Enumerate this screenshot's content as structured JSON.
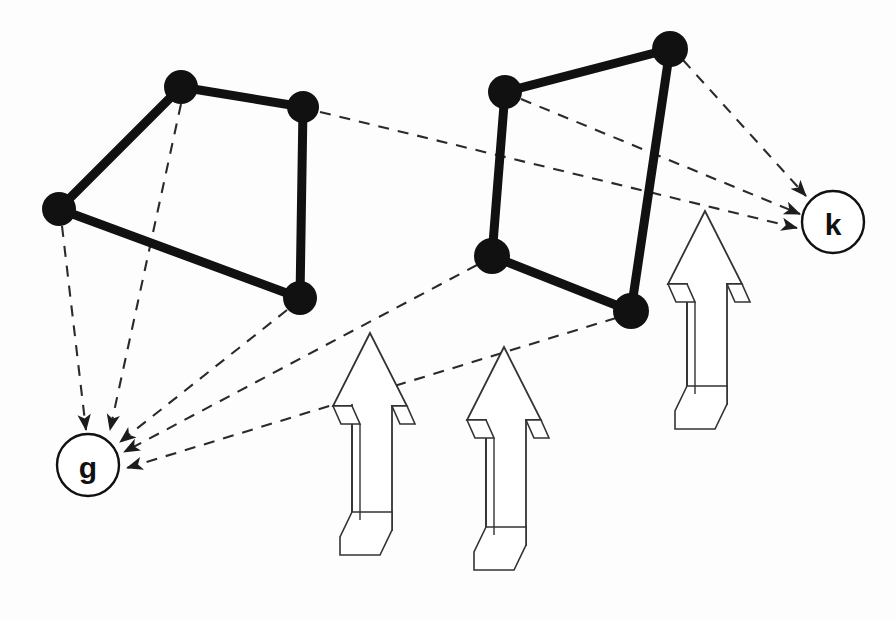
{
  "figure": {
    "background_color": "#fdfdfd",
    "stroke_color": "#111111",
    "solid_edge_color": "#111111",
    "dashed_edge_color": "#2a2a2a",
    "arrow_outline_color": "#333333",
    "arrow_fill_color": "#ffffff"
  },
  "labelled_nodes": [
    {
      "id": "g",
      "label": "g",
      "cx": 88,
      "cy": 465,
      "r": 31
    },
    {
      "id": "k",
      "label": "k",
      "cx": 833,
      "cy": 222,
      "r": 31
    }
  ],
  "clusters": [
    {
      "id": "left-quad",
      "name": "left-quadrilateral",
      "nodes": [
        {
          "id": "L1",
          "cx": 181,
          "cy": 87,
          "r": 17
        },
        {
          "id": "L2",
          "cx": 303,
          "cy": 107,
          "r": 16
        },
        {
          "id": "L3",
          "cx": 59,
          "cy": 209,
          "r": 17
        },
        {
          "id": "L4",
          "cx": 300,
          "cy": 298,
          "r": 17
        }
      ],
      "edges": [
        {
          "from": "L1",
          "to": "L2"
        },
        {
          "from": "L1",
          "to": "L3"
        },
        {
          "from": "L3",
          "to": "L4"
        },
        {
          "from": "L2",
          "to": "L4"
        }
      ]
    },
    {
      "id": "right-quad",
      "name": "right-quadrilateral",
      "nodes": [
        {
          "id": "R1",
          "cx": 505,
          "cy": 92,
          "r": 17
        },
        {
          "id": "R2",
          "cx": 670,
          "cy": 49,
          "r": 18
        },
        {
          "id": "R3",
          "cx": 492,
          "cy": 256,
          "r": 18
        },
        {
          "id": "R4",
          "cx": 631,
          "cy": 311,
          "r": 18
        }
      ],
      "edges": [
        {
          "from": "R1",
          "to": "R2"
        },
        {
          "from": "R1",
          "to": "R3"
        },
        {
          "from": "R3",
          "to": "R4"
        },
        {
          "from": "R2",
          "to": "R4"
        }
      ]
    }
  ],
  "mapping_edges": [
    {
      "id": "m1",
      "from": "L1",
      "to": "g",
      "x1": 181,
      "y1": 104,
      "x2": 110,
      "y2": 430
    },
    {
      "id": "m2",
      "from": "L3",
      "to": "g",
      "x1": 62,
      "y1": 226,
      "x2": 86,
      "y2": 430
    },
    {
      "id": "m3",
      "from": "L4",
      "to": "g",
      "x1": 287,
      "y1": 310,
      "x2": 120,
      "y2": 442
    },
    {
      "id": "m4",
      "from": "R3",
      "to": "g",
      "x1": 477,
      "y1": 265,
      "x2": 124,
      "y2": 452
    },
    {
      "id": "m5",
      "from": "R4",
      "to": "g",
      "x1": 616,
      "y1": 318,
      "x2": 127,
      "y2": 468
    },
    {
      "id": "m6",
      "from": "L2",
      "to": "k",
      "x1": 320,
      "y1": 112,
      "x2": 797,
      "y2": 228
    },
    {
      "id": "m7",
      "from": "R1",
      "to": "k",
      "x1": 521,
      "y1": 99,
      "x2": 800,
      "y2": 214
    },
    {
      "id": "m8",
      "from": "R2",
      "to": "k",
      "x1": 683,
      "y1": 60,
      "x2": 806,
      "y2": 196
    }
  ],
  "block_arrows": [
    {
      "id": "arrow-left",
      "name": "block-arrow-left",
      "tip_x": 370,
      "tip_y": 333,
      "width": 76,
      "height": 222
    },
    {
      "id": "arrow-middle",
      "name": "block-arrow-middle",
      "tip_x": 504,
      "tip_y": 347,
      "width": 76,
      "height": 232
    },
    {
      "id": "arrow-right",
      "name": "block-arrow-right",
      "tip_x": 705,
      "tip_y": 211,
      "width": 76,
      "height": 201
    }
  ],
  "counts": {
    "total_cluster_nodes": 8,
    "total_labelled_nodes": 2,
    "edges_into_g": 5,
    "edges_into_k": 3,
    "block_arrows": 3
  }
}
